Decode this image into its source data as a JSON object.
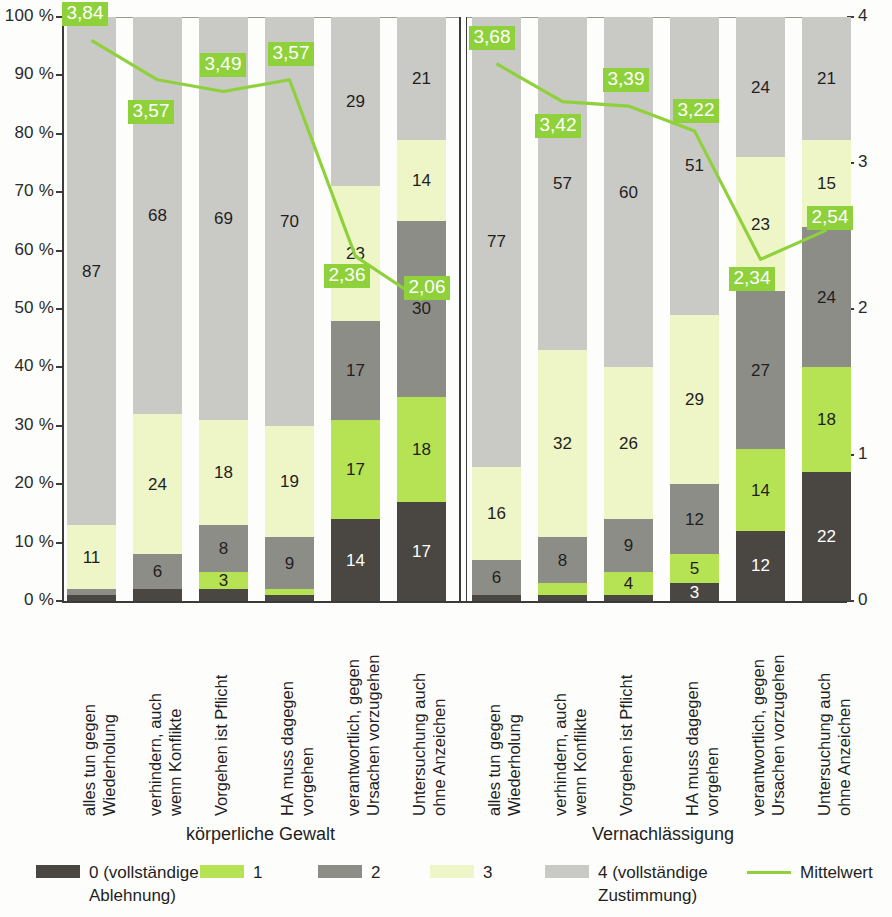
{
  "axes": {
    "left_ticks": [
      "100 %",
      "90 %",
      "80 %",
      "70 %",
      "60 %",
      "50 %",
      "40 %",
      "30 %",
      "20 %",
      "10 %",
      "0 %"
    ],
    "right_ticks": [
      "4",
      "3",
      "2",
      "1",
      "0"
    ]
  },
  "groups": [
    {
      "label": "körperliche Gewalt"
    },
    {
      "label": "Vernachlässigung"
    }
  ],
  "legend": {
    "items": [
      {
        "name": "legend-0",
        "label": "0 (vollständige\nAblehnung)",
        "color": "#4a4641",
        "type": "swatch"
      },
      {
        "name": "legend-1",
        "label": "1",
        "color": "#b6e354",
        "type": "swatch"
      },
      {
        "name": "legend-2",
        "label": "2",
        "color": "#8d8d88",
        "type": "swatch"
      },
      {
        "name": "legend-3",
        "label": "3",
        "color": "#eef5c6",
        "type": "swatch"
      },
      {
        "name": "legend-4",
        "label": "4 (vollständige\nZustimmung)",
        "color": "#c9c9c5",
        "type": "swatch"
      },
      {
        "name": "legend-mean",
        "label": "Mittelwert",
        "color": "#8ed13b",
        "type": "line"
      }
    ]
  },
  "chart_data": {
    "type": "bar",
    "title": "",
    "xlabel": "",
    "ylabel": "",
    "ylim": [
      0,
      100
    ],
    "y2lim": [
      0,
      4
    ],
    "grid": false,
    "legend_position": "bottom",
    "stacked": true,
    "percent_axis_ticks": [
      0,
      10,
      20,
      30,
      40,
      50,
      60,
      70,
      80,
      90,
      100
    ],
    "mean_axis_ticks": [
      0,
      1,
      2,
      3,
      4
    ],
    "series": [
      {
        "name": "0 (vollständige Ablehnung)",
        "color": "#4a4641",
        "values": [
          1,
          2,
          2,
          1,
          14,
          17,
          1,
          1,
          1,
          3,
          12,
          22
        ]
      },
      {
        "name": "1",
        "color": "#b6e354",
        "values": [
          0,
          0,
          3,
          1,
          17,
          18,
          0,
          2,
          4,
          5,
          14,
          18
        ]
      },
      {
        "name": "2",
        "color": "#8d8d88",
        "values": [
          1,
          6,
          8,
          9,
          17,
          30,
          6,
          8,
          9,
          12,
          27,
          24
        ]
      },
      {
        "name": "3",
        "color": "#eef5c6",
        "values": [
          11,
          24,
          18,
          19,
          23,
          14,
          16,
          32,
          26,
          29,
          23,
          15
        ]
      },
      {
        "name": "4 (vollständige Zustimmung)",
        "color": "#c9c9c5",
        "values": [
          87,
          68,
          69,
          70,
          29,
          21,
          77,
          57,
          60,
          51,
          24,
          21
        ]
      }
    ],
    "mean_series": {
      "name": "Mittelwert",
      "color": "#8ed13b",
      "values": [
        3.84,
        3.57,
        3.49,
        3.57,
        2.36,
        2.06,
        3.68,
        3.42,
        3.39,
        3.22,
        2.34,
        2.54
      ],
      "labels": [
        "3,84",
        "3,57",
        "3,49",
        "3,57",
        "2,36",
        "2,06",
        "3,68",
        "3,42",
        "3,39",
        "3,22",
        "2,34",
        "2,54"
      ]
    },
    "categories": [
      "alles tun gegen\nWiederholung",
      "verhindern, auch\nwenn Konflikte",
      "Vorgehen ist Pflicht",
      "HA muss dagegen\nvorgehen",
      "verantwortlich, gegen\nUrsachen vorzugehen",
      "Untersuchung auch\nohne Anzeichen",
      "alles tun gegen\nWiederholung",
      "verhindern, auch\nwenn Konflikte",
      "Vorgehen ist Pflicht",
      "HA muss dagegen\nvorgehen",
      "verantwortlich, gegen\nUrsachen vorzugehen",
      "Untersuchung auch\nohne Anzeichen"
    ],
    "category_groups": [
      "körperliche Gewalt",
      "körperliche Gewalt",
      "körperliche Gewalt",
      "körperliche Gewalt",
      "körperliche Gewalt",
      "körperliche Gewalt",
      "Vernachlässigung",
      "Vernachlässigung",
      "Vernachlässigung",
      "Vernachlässigung",
      "Vernachlässigung",
      "Vernachlässigung"
    ],
    "segment_labels_shown": {
      "note": "Only segments large enough show their numeric label inside the bar",
      "hidden_when_value_below": 3
    }
  }
}
